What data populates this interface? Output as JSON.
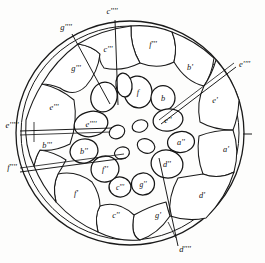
{
  "figure": {
    "type": "anatomical-cross-section-diagram",
    "ink_color": "#1a1a1a",
    "background_color": "#fdfdfc"
  },
  "outer_labels": [
    {
      "id": "c4-top",
      "text": "c''''",
      "x": 112,
      "y": 14,
      "anchor": "middle"
    },
    {
      "id": "g4-topleft",
      "text": "g''''",
      "x": 66,
      "y": 30,
      "anchor": "middle"
    },
    {
      "id": "e4-right",
      "text": "e''''",
      "x": 239,
      "y": 67,
      "anchor": "start"
    },
    {
      "id": "e5-left",
      "text": "e'''''",
      "x": 12,
      "y": 128,
      "anchor": "middle"
    },
    {
      "id": "f4-left",
      "text": "f''''",
      "x": 12,
      "y": 170,
      "anchor": "middle"
    },
    {
      "id": "d4-bottom",
      "text": "d''''",
      "x": 185,
      "y": 252,
      "anchor": "middle"
    }
  ],
  "inner_labels": [
    {
      "id": "c3",
      "text": "c'''",
      "x": 108,
      "y": 52,
      "anchor": "middle"
    },
    {
      "id": "f3",
      "text": "f'''",
      "x": 153,
      "y": 47,
      "anchor": "middle"
    },
    {
      "id": "g3",
      "text": "g'''",
      "x": 76,
      "y": 71,
      "anchor": "middle"
    },
    {
      "id": "b1",
      "text": "b'",
      "x": 190,
      "y": 70,
      "anchor": "middle"
    },
    {
      "id": "f0",
      "text": "f",
      "x": 138,
      "y": 93,
      "anchor": "middle"
    },
    {
      "id": "b0",
      "text": "b",
      "x": 163,
      "y": 98,
      "anchor": "middle"
    },
    {
      "id": "e1",
      "text": "e'",
      "x": 215,
      "y": 103,
      "anchor": "middle"
    },
    {
      "id": "e2",
      "text": "e''",
      "x": 167,
      "y": 120,
      "anchor": "middle"
    },
    {
      "id": "e1b",
      "text": "e'''",
      "x": 54,
      "y": 107,
      "anchor": "middle"
    },
    {
      "id": "e3",
      "text": "e''''",
      "x": 90,
      "y": 125,
      "anchor": "middle"
    },
    {
      "id": "a2",
      "text": "a''",
      "x": 181,
      "y": 142,
      "anchor": "middle"
    },
    {
      "id": "a1",
      "text": "a'",
      "x": 226,
      "y": 152,
      "anchor": "middle"
    },
    {
      "id": "b2",
      "text": "b''",
      "x": 84,
      "y": 152,
      "anchor": "middle"
    },
    {
      "id": "b3",
      "text": "b'''",
      "x": 47,
      "y": 148,
      "anchor": "middle"
    },
    {
      "id": "d2",
      "text": "d''",
      "x": 167,
      "y": 163,
      "anchor": "middle"
    },
    {
      "id": "f2",
      "text": "f''",
      "x": 105,
      "y": 170,
      "anchor": "middle"
    },
    {
      "id": "g2",
      "text": "g''",
      "x": 143,
      "y": 184,
      "anchor": "middle"
    },
    {
      "id": "c3b",
      "text": "c'''",
      "x": 120,
      "y": 187,
      "anchor": "middle"
    },
    {
      "id": "d1",
      "text": "d'",
      "x": 202,
      "y": 198,
      "anchor": "middle"
    },
    {
      "id": "f1",
      "text": "f'",
      "x": 76,
      "y": 196,
      "anchor": "middle"
    },
    {
      "id": "c2",
      "text": "c''",
      "x": 116,
      "y": 218,
      "anchor": "middle"
    },
    {
      "id": "g1",
      "text": "g'",
      "x": 158,
      "y": 218,
      "anchor": "middle"
    }
  ],
  "geometry": {
    "center_x": 130,
    "center_y": 133,
    "outer_radius": 114,
    "inner_radius": 109
  }
}
